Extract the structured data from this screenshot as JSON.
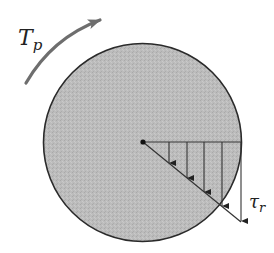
{
  "diagram": {
    "torque_label": {
      "main": "T",
      "sub": "p"
    },
    "stress_label": {
      "main": "τ",
      "sub": "r"
    },
    "colors": {
      "shaft_fill": "#bdbdbd",
      "shaft_stroke": "#2a2a2a",
      "torque_arrow": "#6e6e6e",
      "lines": "#333333"
    },
    "shaft": {
      "cx": 142.5,
      "cy": 142.5,
      "r": 99
    },
    "center_dot": {
      "x": 143,
      "y": 142
    },
    "stress_arrows_x": [
      169,
      187,
      204,
      222,
      241
    ],
    "stress_arrow_tips_y": [
      163,
      178,
      192,
      206,
      221
    ]
  }
}
